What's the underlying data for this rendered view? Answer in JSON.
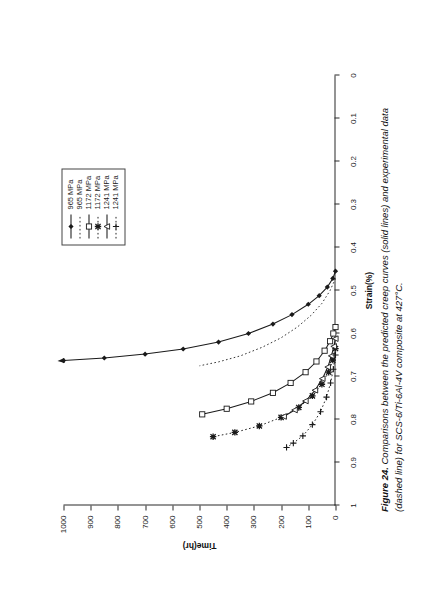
{
  "figure": {
    "caption_label": "Figure 24.",
    "caption_text": " Comparisons between the predicted creep curves (solid lines) and experimental data (dashed line) for SCS-6/Ti-6Al-4V composite at 427°C."
  },
  "chart_data": {
    "type": "line",
    "title": "",
    "orientation": "rotated-90ccw",
    "xlabel": "Strain(%)",
    "ylabel": "Time(hr)",
    "xlim": [
      0,
      1
    ],
    "ylim": [
      0,
      1000
    ],
    "x_ticks": [
      0,
      0.1,
      0.2,
      0.3,
      0.4,
      0.5,
      0.6,
      0.7,
      0.8,
      0.9,
      1
    ],
    "x_tick_labels": [
      "0",
      "0.1",
      "0.2",
      "0.3",
      "0.4",
      "0.5",
      "0.6",
      "0.7",
      "0.8",
      "0.9",
      "1"
    ],
    "y_ticks": [
      0,
      100,
      200,
      300,
      400,
      500,
      600,
      700,
      800,
      900,
      1000
    ],
    "y_tick_labels": [
      "0",
      "100",
      "200",
      "300",
      "400",
      "500",
      "600",
      "700",
      "800",
      "900",
      "1000"
    ],
    "grid": false,
    "legend_position": "top-right",
    "axis_note": "Plotted sideways: Strain(%) on the horizontal page axis decreasing left-to-right, Time(hr) on the vertical page axis increasing upward.",
    "series": [
      {
        "name": "965 MPa",
        "label": "965 MPa",
        "style": "solid",
        "marker": "filled-diamond",
        "color": "#1a1a1a",
        "kind": "predicted",
        "points": [
          {
            "time": 0,
            "strain": 0.455
          },
          {
            "time": 10,
            "strain": 0.472
          },
          {
            "time": 30,
            "strain": 0.492
          },
          {
            "time": 60,
            "strain": 0.512
          },
          {
            "time": 100,
            "strain": 0.532
          },
          {
            "time": 160,
            "strain": 0.556
          },
          {
            "time": 230,
            "strain": 0.578
          },
          {
            "time": 320,
            "strain": 0.6
          },
          {
            "time": 430,
            "strain": 0.62
          },
          {
            "time": 560,
            "strain": 0.636
          },
          {
            "time": 700,
            "strain": 0.648
          },
          {
            "time": 850,
            "strain": 0.657
          },
          {
            "time": 1000,
            "strain": 0.663
          }
        ]
      },
      {
        "name": "965 MPa",
        "label": "965 MPa",
        "style": "dotted",
        "marker": "none",
        "color": "#2b2b2b",
        "kind": "experimental",
        "points": [
          {
            "time": 0,
            "strain": 0.472
          },
          {
            "time": 20,
            "strain": 0.5
          },
          {
            "time": 50,
            "strain": 0.53
          },
          {
            "time": 90,
            "strain": 0.558
          },
          {
            "time": 140,
            "strain": 0.585
          },
          {
            "time": 200,
            "strain": 0.61
          },
          {
            "time": 270,
            "strain": 0.632
          },
          {
            "time": 350,
            "strain": 0.652
          },
          {
            "time": 430,
            "strain": 0.666
          },
          {
            "time": 500,
            "strain": 0.675
          }
        ]
      },
      {
        "name": "1172 MPa",
        "label": "1172 MPa",
        "style": "solid",
        "marker": "open-square",
        "color": "#1a1a1a",
        "kind": "predicted",
        "points": [
          {
            "time": 0,
            "strain": 0.585
          },
          {
            "time": 8,
            "strain": 0.6
          },
          {
            "time": 20,
            "strain": 0.618
          },
          {
            "time": 40,
            "strain": 0.64
          },
          {
            "time": 70,
            "strain": 0.665
          },
          {
            "time": 110,
            "strain": 0.69
          },
          {
            "time": 165,
            "strain": 0.715
          },
          {
            "time": 230,
            "strain": 0.738
          },
          {
            "time": 310,
            "strain": 0.758
          },
          {
            "time": 400,
            "strain": 0.775
          },
          {
            "time": 490,
            "strain": 0.788
          }
        ]
      },
      {
        "name": "1172 MPa",
        "label": "1172 MPa",
        "style": "dotted",
        "marker": "asterisk",
        "color": "#1a1a1a",
        "kind": "experimental",
        "points": [
          {
            "time": 0,
            "strain": 0.635
          },
          {
            "time": 10,
            "strain": 0.662
          },
          {
            "time": 25,
            "strain": 0.69
          },
          {
            "time": 50,
            "strain": 0.718
          },
          {
            "time": 85,
            "strain": 0.745
          },
          {
            "time": 135,
            "strain": 0.772
          },
          {
            "time": 200,
            "strain": 0.795
          },
          {
            "time": 280,
            "strain": 0.815
          },
          {
            "time": 370,
            "strain": 0.83
          },
          {
            "time": 450,
            "strain": 0.84
          }
        ]
      },
      {
        "name": "1241 MPa",
        "label": "1241 MPa",
        "style": "solid",
        "marker": "open-triangle",
        "color": "#1a1a1a",
        "kind": "predicted",
        "points": [
          {
            "time": 0,
            "strain": 0.612
          },
          {
            "time": 6,
            "strain": 0.63
          },
          {
            "time": 15,
            "strain": 0.652
          },
          {
            "time": 28,
            "strain": 0.678
          },
          {
            "time": 48,
            "strain": 0.705
          },
          {
            "time": 75,
            "strain": 0.732
          },
          {
            "time": 110,
            "strain": 0.757
          },
          {
            "time": 150,
            "strain": 0.778
          },
          {
            "time": 190,
            "strain": 0.793
          }
        ]
      },
      {
        "name": "1241 MPa",
        "label": "1241 MPa",
        "style": "dotted",
        "marker": "plus",
        "color": "#1a1a1a",
        "kind": "experimental",
        "points": [
          {
            "time": 0,
            "strain": 0.65
          },
          {
            "time": 8,
            "strain": 0.683
          },
          {
            "time": 18,
            "strain": 0.715
          },
          {
            "time": 33,
            "strain": 0.748
          },
          {
            "time": 55,
            "strain": 0.782
          },
          {
            "time": 85,
            "strain": 0.812
          },
          {
            "time": 120,
            "strain": 0.838
          },
          {
            "time": 155,
            "strain": 0.855
          },
          {
            "time": 180,
            "strain": 0.865
          }
        ]
      }
    ]
  }
}
